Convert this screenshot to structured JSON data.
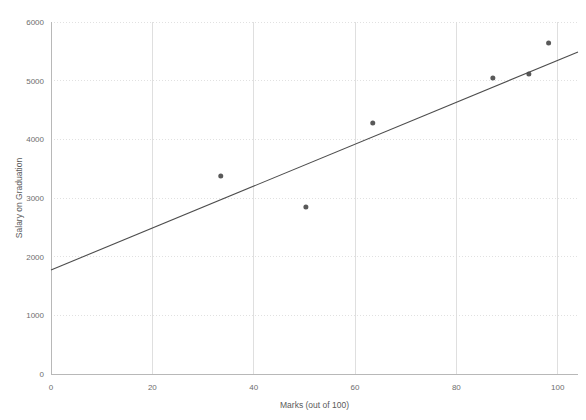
{
  "chart_data": {
    "type": "scatter",
    "title": "",
    "xlabel": "Marks (out of 100)",
    "ylabel": "Salary on Graduation",
    "xlim": [
      0,
      104
    ],
    "ylim": [
      0,
      6000
    ],
    "xticks": [
      0,
      20,
      40,
      60,
      80,
      100
    ],
    "xtick_labels": [
      "0",
      "20",
      "40",
      "60",
      "80",
      "100"
    ],
    "yticks": [
      0,
      1000,
      2000,
      3000,
      4000,
      5000,
      6000
    ],
    "ytick_labels": [
      "0",
      "1000",
      "2000",
      "3000",
      "4000",
      "5000",
      "6000"
    ],
    "grid": true,
    "grid_axis": "both",
    "legend": false,
    "legend_position": "none",
    "marker_color": "#595959",
    "marker_size": 5,
    "series": [
      {
        "name": "Students",
        "type": "scatter",
        "points": [
          {
            "x": 33.5,
            "y": 3375
          },
          {
            "x": 50.3,
            "y": 2847
          },
          {
            "x": 63.5,
            "y": 4280
          },
          {
            "x": 87.2,
            "y": 5045
          },
          {
            "x": 94.3,
            "y": 5113
          },
          {
            "x": 98.2,
            "y": 5642
          }
        ]
      },
      {
        "name": "Linear trendline",
        "type": "line",
        "color": "#4d4d4d",
        "points": [
          {
            "x": 0,
            "y": 1773
          },
          {
            "x": 104,
            "y": 5490
          }
        ]
      }
    ]
  }
}
